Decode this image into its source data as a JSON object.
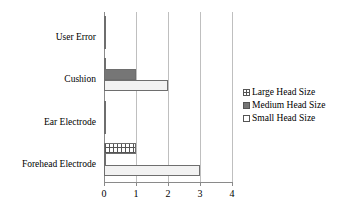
{
  "chart_data": {
    "type": "bar",
    "orientation": "horizontal",
    "title": "",
    "xlabel": "",
    "ylabel": "",
    "xlim": [
      0,
      4
    ],
    "xticks": [
      "0",
      "1",
      "2",
      "3",
      "4"
    ],
    "grid": true,
    "legend_position": "right",
    "categories": [
      "User Error",
      "Cushion",
      "Ear Electrode",
      "Forehead Electrode"
    ],
    "series": [
      {
        "name": "Large Head Size",
        "pattern": "grid-hatch",
        "color": "#ffffff",
        "values": [
          0.03,
          0.03,
          0.03,
          1
        ]
      },
      {
        "name": "Medium Head Size",
        "pattern": "solid-dark-gray",
        "color": "#767676",
        "values": [
          0.03,
          1,
          0.03,
          0.03
        ]
      },
      {
        "name": "Small Head Size",
        "pattern": "fine-dot",
        "color": "#f2f2f2",
        "values": [
          0.03,
          2,
          0.03,
          3
        ]
      }
    ]
  },
  "legend": {
    "items": [
      {
        "label": "Large Head Size",
        "size_class": "sz-large"
      },
      {
        "label": "Medium Head Size",
        "size_class": "sz-medium"
      },
      {
        "label": "Small Head Size",
        "size_class": "sz-small"
      }
    ]
  },
  "axis": {
    "grid_color": "#bfbfbf",
    "axis_color": "#8a8a8a"
  }
}
